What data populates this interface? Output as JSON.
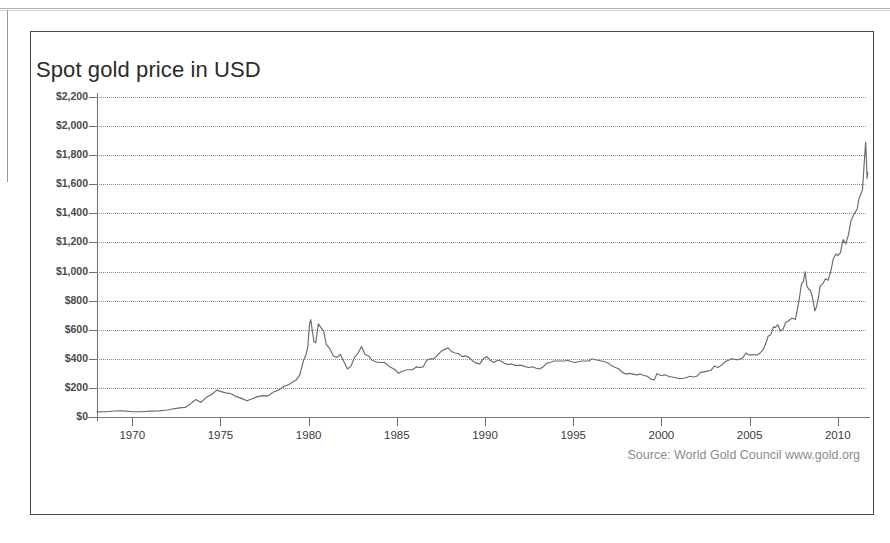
{
  "page": {
    "clipped_heading_fragment": "",
    "background_color": "#ffffff"
  },
  "figure": {
    "border_color": "#4a4a4a",
    "source_note": "Source: World Gold Council www.gold.org"
  },
  "chart_data": {
    "type": "line",
    "title": "Spot gold price in USD",
    "xlabel": "",
    "ylabel": "",
    "grid": true,
    "legend": null,
    "line_color": "#6a6a6a",
    "xlim": [
      1968.0,
      2011.6
    ],
    "ylim": [
      0,
      2200
    ],
    "ytick_labels": [
      "$2,200",
      "$2,000",
      "$1,800",
      "$1,600",
      "$1,400",
      "$1,200",
      "$1,000",
      "$800",
      "$600",
      "$400",
      "$200",
      "$0"
    ],
    "ytick_values": [
      2200,
      2000,
      1800,
      1600,
      1400,
      1200,
      1000,
      800,
      600,
      400,
      200,
      0
    ],
    "xtick_labels": [
      "1970",
      "1975",
      "1980",
      "1985",
      "1990",
      "1995",
      "2000",
      "2005",
      "2010"
    ],
    "xtick_values": [
      1970,
      1975,
      1980,
      1985,
      1990,
      1995,
      2000,
      2005,
      2010
    ],
    "series": [
      {
        "name": "Spot gold price in USD",
        "x": [
          1968.0,
          1968.5,
          1969.0,
          1969.5,
          1970.0,
          1970.5,
          1971.0,
          1971.5,
          1972.0,
          1972.4,
          1972.8,
          1973.0,
          1973.3,
          1973.6,
          1973.9,
          1974.2,
          1974.5,
          1974.8,
          1975.0,
          1975.3,
          1975.6,
          1975.9,
          1976.2,
          1976.5,
          1976.8,
          1977.1,
          1977.4,
          1977.7,
          1978.0,
          1978.3,
          1978.6,
          1978.9,
          1979.1,
          1979.3,
          1979.5,
          1979.7,
          1979.85,
          1979.95,
          1980.05,
          1980.12,
          1980.2,
          1980.3,
          1980.4,
          1980.55,
          1980.7,
          1980.85,
          1981.0,
          1981.2,
          1981.4,
          1981.6,
          1981.8,
          1982.0,
          1982.2,
          1982.4,
          1982.6,
          1982.8,
          1983.0,
          1983.2,
          1983.4,
          1983.6,
          1983.8,
          1984.0,
          1984.3,
          1984.6,
          1984.9,
          1985.1,
          1985.3,
          1985.6,
          1985.9,
          1986.1,
          1986.3,
          1986.5,
          1986.7,
          1986.9,
          1987.1,
          1987.3,
          1987.5,
          1987.7,
          1987.9,
          1988.1,
          1988.3,
          1988.5,
          1988.7,
          1988.9,
          1989.1,
          1989.3,
          1989.5,
          1989.7,
          1989.9,
          1990.1,
          1990.3,
          1990.5,
          1990.7,
          1990.9,
          1991.1,
          1991.3,
          1991.5,
          1991.7,
          1991.9,
          1992.1,
          1992.3,
          1992.5,
          1992.7,
          1992.9,
          1993.1,
          1993.3,
          1993.5,
          1993.7,
          1993.9,
          1994.1,
          1994.3,
          1994.5,
          1994.7,
          1994.9,
          1995.1,
          1995.3,
          1995.5,
          1995.7,
          1995.9,
          1996.05,
          1996.2,
          1996.4,
          1996.6,
          1996.8,
          1997.0,
          1997.2,
          1997.4,
          1997.6,
          1997.8,
          1998.0,
          1998.2,
          1998.4,
          1998.6,
          1998.8,
          1999.0,
          1999.2,
          1999.4,
          1999.6,
          1999.75,
          1999.85,
          2000.0,
          2000.2,
          2000.4,
          2000.6,
          2000.8,
          2001.0,
          2001.2,
          2001.4,
          2001.6,
          2001.8,
          2002.0,
          2002.2,
          2002.4,
          2002.6,
          2002.8,
          2003.0,
          2003.2,
          2003.4,
          2003.6,
          2003.8,
          2004.0,
          2004.2,
          2004.4,
          2004.6,
          2004.8,
          2005.0,
          2005.2,
          2005.4,
          2005.6,
          2005.8,
          2005.95,
          2006.05,
          2006.2,
          2006.35,
          2006.45,
          2006.6,
          2006.75,
          2006.9,
          2007.05,
          2007.2,
          2007.4,
          2007.6,
          2007.8,
          2007.95,
          2008.05,
          2008.15,
          2008.25,
          2008.35,
          2008.45,
          2008.55,
          2008.7,
          2008.8,
          2008.9,
          2009.0,
          2009.15,
          2009.3,
          2009.45,
          2009.6,
          2009.75,
          2009.9,
          2010.0,
          2010.15,
          2010.3,
          2010.45,
          2010.6,
          2010.75,
          2010.9,
          2011.0,
          2011.1,
          2011.2,
          2011.3,
          2011.4,
          2011.5,
          2011.58,
          2011.62,
          2011.66,
          2011.7
        ],
        "y": [
          35,
          36,
          41,
          42,
          36,
          36,
          40,
          42,
          48,
          58,
          64,
          65,
          90,
          120,
          100,
          135,
          155,
          185,
          176,
          166,
          160,
          140,
          128,
          112,
          125,
          140,
          147,
          145,
          172,
          185,
          210,
          225,
          240,
          255,
          290,
          385,
          430,
          480,
          640,
          670,
          600,
          520,
          510,
          640,
          615,
          590,
          500,
          470,
          420,
          410,
          430,
          380,
          330,
          350,
          410,
          440,
          485,
          430,
          420,
          390,
          380,
          375,
          375,
          345,
          325,
          300,
          315,
          325,
          325,
          345,
          340,
          345,
          390,
          400,
          400,
          425,
          450,
          465,
          475,
          450,
          440,
          435,
          415,
          420,
          410,
          385,
          370,
          365,
          400,
          415,
          390,
          375,
          390,
          385,
          370,
          360,
          365,
          355,
          355,
          355,
          345,
          340,
          345,
          335,
          330,
          345,
          370,
          375,
          385,
          385,
          385,
          385,
          390,
          380,
          375,
          380,
          385,
          385,
          385,
          400,
          395,
          390,
          385,
          380,
          370,
          350,
          340,
          330,
          305,
          295,
          300,
          295,
          290,
          295,
          285,
          280,
          260,
          255,
          300,
          290,
          285,
          290,
          280,
          275,
          270,
          265,
          265,
          270,
          280,
          275,
          280,
          305,
          310,
          315,
          320,
          350,
          340,
          355,
          380,
          390,
          400,
          395,
          395,
          405,
          440,
          425,
          430,
          425,
          440,
          470,
          515,
          555,
          565,
          620,
          615,
          635,
          590,
          605,
          650,
          660,
          680,
          670,
          800,
          920,
          930,
          1000,
          900,
          880,
          870,
          830,
          730,
          760,
          820,
          900,
          915,
          950,
          940,
          1000,
          1090,
          1120,
          1110,
          1130,
          1220,
          1190,
          1250,
          1350,
          1390,
          1410,
          1430,
          1500,
          1530,
          1560,
          1750,
          1890,
          1780,
          1640,
          1680
        ]
      }
    ],
    "annotations": [
      {
        "text": "Source: World Gold Council www.gold.org",
        "position": "bottom-right"
      }
    ]
  }
}
